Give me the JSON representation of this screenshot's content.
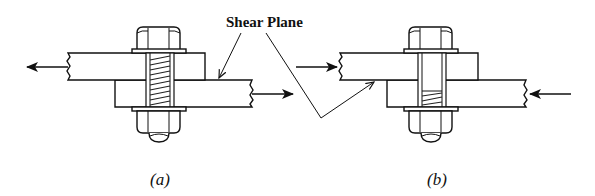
{
  "diagram": {
    "annotation": {
      "label": "Shear Plane",
      "color": "#111111"
    },
    "panels": [
      {
        "id": "a",
        "caption": "(a)",
        "load_direction": "tension",
        "left_arrow": "left",
        "right_arrow": "right",
        "thread_in_shear_plane": true
      },
      {
        "id": "b",
        "caption": "(b)",
        "load_direction": "compression",
        "left_arrow": "right",
        "right_arrow": "left",
        "thread_in_shear_plane": false
      }
    ],
    "colors": {
      "line": "#111111",
      "background": "#ffffff"
    }
  }
}
